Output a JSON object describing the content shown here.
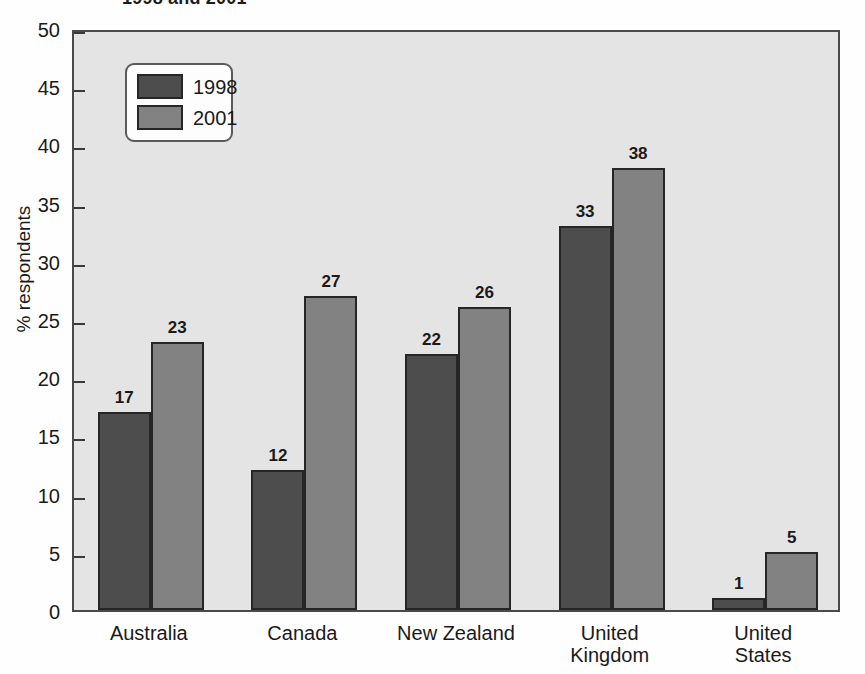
{
  "chart_data": {
    "type": "bar",
    "title": "1998 and 2001",
    "xlabel": "",
    "ylabel": "% respondents",
    "ylim": [
      0,
      50
    ],
    "ytick_step": 5,
    "yticks": [
      "0",
      "5",
      "10",
      "15",
      "20",
      "25",
      "30",
      "35",
      "40",
      "45",
      "50"
    ],
    "grid": false,
    "legend_position": "inside top-left",
    "categories": [
      "Australia",
      "Canada",
      "New Zealand",
      "United\nKingdom",
      "United\nStates"
    ],
    "series": [
      {
        "name": "1998",
        "color": "#4d4d4d",
        "values": [
          17,
          12,
          22,
          33,
          1
        ]
      },
      {
        "name": "2001",
        "color": "#828282",
        "values": [
          23,
          27,
          26,
          38,
          5
        ]
      }
    ],
    "data_labels": {
      "1998": [
        "17",
        "12",
        "22",
        "33",
        "1"
      ],
      "2001": [
        "23",
        "27",
        "26",
        "38",
        "5"
      ]
    },
    "colors": {
      "plot_background": "#e4e4e4",
      "axis": "#4a4a4a",
      "bar_outline": "#262626",
      "page_background": "#fefefe"
    }
  },
  "legend": {
    "items": [
      {
        "label": "1998",
        "swatch": "dark-gray"
      },
      {
        "label": "2001",
        "swatch": "medium-gray"
      }
    ]
  }
}
